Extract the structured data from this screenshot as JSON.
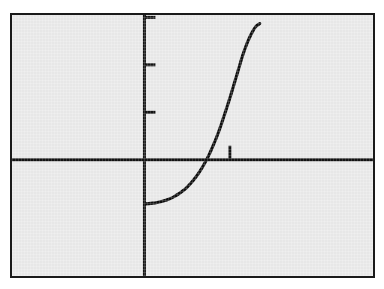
{
  "figure": {
    "title": "",
    "panel": {
      "background_color": "#e9e9e9",
      "border_color": "#1a1a1a",
      "outer_background_color": "#ffffff"
    }
  },
  "chart_data": {
    "type": "line",
    "title": "",
    "subtitle": "",
    "xlabel": "",
    "ylabel": "",
    "grid": false,
    "legend": null,
    "legend_position": "none",
    "axis_style": "two-axis-cross",
    "curve_color": "#101010",
    "axis_color": "#141414",
    "xlim": [
      -3.1,
      5.35
    ],
    "ylim": [
      -2.45,
      3.05
    ],
    "x_axis_y_value": 0,
    "y_axis_x_value": 0,
    "xticks": [
      2
    ],
    "xtick_labels": [
      ""
    ],
    "yticks": [
      1,
      2,
      3
    ],
    "ytick_labels": [
      "",
      "",
      ""
    ],
    "tick_direction": "inward",
    "series": [
      {
        "name": "curve",
        "x": [
          0.0,
          0.1,
          0.2,
          0.3,
          0.4,
          0.5,
          0.6,
          0.7,
          0.8,
          0.9,
          1.0,
          1.1,
          1.2,
          1.3,
          1.4,
          1.5,
          1.6,
          1.7,
          1.8,
          1.9,
          2.0,
          2.1,
          2.2,
          2.3,
          2.4,
          2.5,
          2.6,
          2.7
        ],
        "y": [
          -0.93,
          -0.925,
          -0.915,
          -0.9,
          -0.88,
          -0.855,
          -0.82,
          -0.775,
          -0.72,
          -0.655,
          -0.575,
          -0.48,
          -0.37,
          -0.24,
          -0.09,
          0.08,
          0.28,
          0.5,
          0.75,
          1.02,
          1.3,
          1.6,
          1.9,
          2.2,
          2.45,
          2.65,
          2.8,
          2.87
        ]
      }
    ],
    "curve_endpoints": {
      "left": {
        "x": 0.0,
        "y": -0.93
      },
      "right": {
        "x": 2.7,
        "y": 2.87
      },
      "x_intercept": {
        "x": 1.45,
        "y": 0
      }
    }
  },
  "elements": {
    "x_axis_name": "horizontal-axis",
    "y_axis_name": "vertical-axis",
    "curve_name": "exponential-curve",
    "ytick_names": [
      "ytick-1",
      "ytick-2",
      "ytick-3"
    ],
    "xtick_names": [
      "xtick-1"
    ]
  }
}
